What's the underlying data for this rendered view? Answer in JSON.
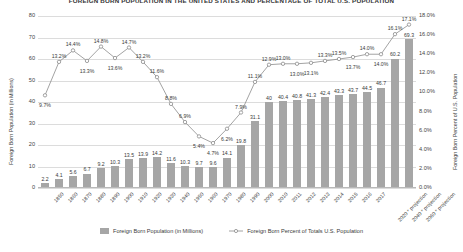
{
  "chart_data": {
    "type": "bar",
    "title": "FOREIGN BORN POPULATION IN THE UNITED STATES AND PERCENTAGE OF TOTAL U.S. POPULATION",
    "xlabel": "",
    "ylabel": "Foreign Born Population (in Millions)",
    "y2label": "Foreign Born Percent of U.S. Population",
    "ylim": [
      0,
      80
    ],
    "y2lim": [
      0,
      18
    ],
    "grid": true,
    "legend_position": "bottom",
    "categories": [
      "1850",
      "1860",
      "1870",
      "1880",
      "1890",
      "1900",
      "1910",
      "1920",
      "1930",
      "1940",
      "1950",
      "1960",
      "1970",
      "1980",
      "1990",
      "2000",
      "2010",
      "2011",
      "2012",
      "2013",
      "2014",
      "2015",
      "2016",
      "2017",
      "2020 * projection",
      "2040 * projection",
      "2060 * projection"
    ],
    "yticks": [
      "0",
      "10",
      "20",
      "30",
      "40",
      "50",
      "60",
      "70",
      "80"
    ],
    "y2ticks": [
      "0.0%",
      "2.0%",
      "4.0%",
      "6.0%",
      "8.0%",
      "10.0%",
      "12.0%",
      "14.0%",
      "16.0%",
      "18.0%"
    ],
    "series": [
      {
        "name": "Foreign Born Population (in Millions)",
        "type": "bar",
        "color": "#a6a6a6",
        "axis": "left",
        "values": [
          2.2,
          4.1,
          5.6,
          6.7,
          9.2,
          10.3,
          13.5,
          13.9,
          14.2,
          11.6,
          10.3,
          9.7,
          9.6,
          14.1,
          19.8,
          31.1,
          40,
          40.4,
          40.8,
          41.3,
          42.4,
          43.3,
          43.7,
          44.5,
          46.7,
          60.2,
          69.3
        ],
        "labels": [
          "2.2",
          "4.1",
          "5.6",
          "6.7",
          "9.2",
          "10.3",
          "13.5",
          "13.9",
          "14.2",
          "11.6",
          "10.3",
          "9.7",
          "9.6",
          "14.1",
          "19.8",
          "31.1",
          "40",
          "40.4",
          "40.8",
          "41.3",
          "42.4",
          "43.3",
          "43.7",
          "44.5",
          "46.7",
          "60.2",
          "69.3"
        ]
      },
      {
        "name": "Foreign Born Percent of Totals U.S. Population",
        "type": "line",
        "color": "#8c8c8c",
        "axis": "right",
        "values": [
          9.7,
          13.2,
          14.4,
          13.3,
          14.8,
          13.6,
          14.7,
          13.2,
          11.6,
          8.8,
          6.9,
          5.4,
          4.7,
          6.2,
          7.9,
          11.1,
          12.9,
          13.0,
          13.0,
          13.1,
          13.3,
          13.5,
          13.7,
          14.0,
          14.0,
          16.1,
          17.1
        ],
        "labels": [
          "9.7%",
          "13.2%",
          "14.4%",
          "13.3%",
          "14.8%",
          "13.6%",
          "14.7%",
          "13.2%",
          "11.6%",
          "8.8%",
          "6.9%",
          "5.4%",
          "4.7%",
          "6.2%",
          "7.9%",
          "11.1%",
          "12.9%",
          "13.0%",
          "13.0%",
          "13.1%",
          "13.3%",
          "13.5%",
          "13.7%",
          "14.0%",
          "14.0%",
          "16.1%",
          "17.1%"
        ],
        "label_above": [
          false,
          true,
          true,
          false,
          true,
          false,
          true,
          true,
          true,
          true,
          true,
          false,
          false,
          false,
          true,
          true,
          true,
          true,
          false,
          false,
          true,
          true,
          false,
          true,
          false,
          true,
          true
        ]
      }
    ]
  },
  "legend": {
    "bar_label": "Foreign Born Population (in Millions)",
    "line_label": "Foreign Born Percent of Totals U.S. Population"
  }
}
